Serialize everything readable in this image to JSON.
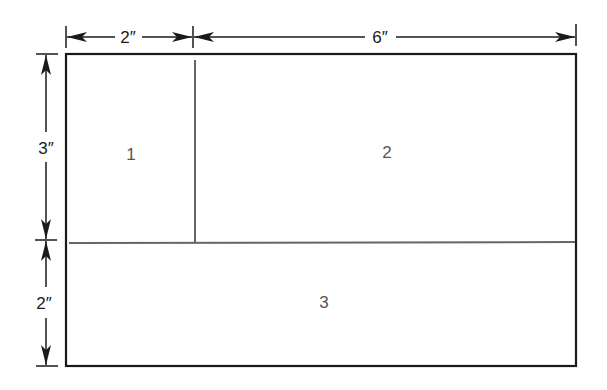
{
  "diagram": {
    "type": "dimensioned-rectangle-layout",
    "colors": {
      "outline": "#1a1a1a",
      "divider": "#666666",
      "region_label": "#555555",
      "dimension": "#1a1a1a"
    },
    "dimensions": {
      "top": [
        {
          "label": "2″",
          "value_in": 2
        },
        {
          "label": "6″",
          "value_in": 6
        }
      ],
      "left": [
        {
          "label": "3″",
          "value_in": 3
        },
        {
          "label": "2″",
          "value_in": 2
        }
      ]
    },
    "regions": [
      {
        "id": 1,
        "label": "1",
        "width_in": 2,
        "height_in": 3
      },
      {
        "id": 2,
        "label": "2",
        "width_in": 6,
        "height_in": 3
      },
      {
        "id": 3,
        "label": "3",
        "width_in": 8,
        "height_in": 2
      }
    ],
    "total": {
      "width_in": 8,
      "height_in": 5
    }
  }
}
